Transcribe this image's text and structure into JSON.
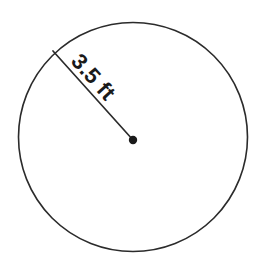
{
  "figure": {
    "type": "geometry-diagram",
    "shape_name": "circle",
    "background_color": "#ffffff",
    "width": 265,
    "height": 264
  },
  "circle": {
    "center_x": 133,
    "center_y": 137,
    "radius_px": 115,
    "stroke_color": "#2b2b2b",
    "stroke_width": 1.6,
    "fill_color": "#ffffff"
  },
  "radius_segment": {
    "start_x": 53,
    "start_y": 51,
    "end_x": 133,
    "end_y": 140,
    "stroke_color": "#2b2b2b",
    "stroke_width": 1.7
  },
  "center_point": {
    "cx": 133,
    "cy": 140,
    "r": 4.2,
    "fill_color": "#1a1a1a"
  },
  "label": {
    "text": "3.5 ft",
    "value": "3.5",
    "unit": "ft",
    "color": "#1a1a1a",
    "font_size_px": 22,
    "rotation_deg": 48,
    "x": 70,
    "y": 62
  }
}
